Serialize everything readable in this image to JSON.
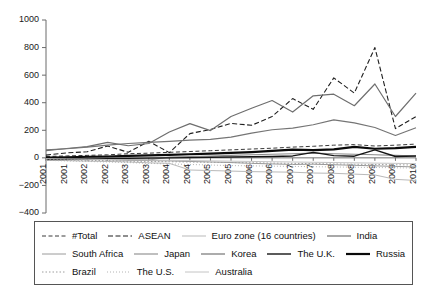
{
  "chart_data": {
    "type": "line",
    "title": "",
    "subtitle": "",
    "xlabel": "",
    "ylabel": "",
    "ylim": [
      -400,
      1000
    ],
    "yticks": [
      1000,
      800,
      600,
      400,
      200,
      0,
      -200,
      -400
    ],
    "grid": false,
    "legend_position": "bottom",
    "x": [
      "2001",
      "2001",
      "2002",
      "2002",
      "2003",
      "2003",
      "2004",
      "2004",
      "2005",
      "2005",
      "2006",
      "2006",
      "2007",
      "2007",
      "2008",
      "2008",
      "2009",
      "2009",
      "2010"
    ],
    "categories": [
      "2001",
      "2001",
      "2002",
      "2002",
      "2003",
      "2003",
      "2004",
      "2004",
      "2005",
      "2005",
      "2006",
      "2006",
      "2007",
      "2007",
      "2008",
      "2008",
      "2009",
      "2009",
      "2010"
    ],
    "series": [
      {
        "name": "#Total",
        "style": "dashed",
        "color": "#3a3a3a",
        "width": 1,
        "dash": "4,2.5",
        "values": [
          10,
          14,
          18,
          22,
          30,
          34,
          40,
          46,
          52,
          58,
          64,
          70,
          78,
          84,
          92,
          96,
          86,
          92,
          100
        ]
      },
      {
        "name": "ASEAN",
        "style": "dashed",
        "color": "#1f1f1f",
        "width": 1.1,
        "dash": "5,2.5",
        "values": [
          20,
          36,
          44,
          86,
          40,
          120,
          38,
          176,
          206,
          250,
          236,
          300,
          430,
          352,
          580,
          470,
          800,
          212,
          300
        ]
      },
      {
        "name": "Euro zone (16 countries)",
        "style": "solid",
        "color": "#b9b9b9",
        "width": 1,
        "dash": "none",
        "values": [
          -16,
          -20,
          -24,
          -26,
          -30,
          -36,
          -40,
          -88,
          -92,
          -96,
          -100,
          -102,
          -104,
          -110,
          -112,
          -118,
          -124,
          -156,
          -164
        ]
      },
      {
        "name": "India",
        "style": "solid",
        "color": "#6e6e6e",
        "width": 1.2,
        "dash": "none",
        "values": [
          52,
          68,
          82,
          112,
          88,
          104,
          188,
          248,
          198,
          300,
          360,
          416,
          332,
          450,
          462,
          378,
          536,
          300,
          470
        ]
      },
      {
        "name": "South Africa",
        "style": "solid",
        "color": "#9a9a9a",
        "width": 1,
        "dash": "none",
        "values": [
          -8,
          -10,
          -12,
          -14,
          -18,
          -20,
          -22,
          -26,
          -30,
          -34,
          -40,
          -44,
          -48,
          -46,
          -50,
          -54,
          -58,
          -62,
          -66
        ]
      },
      {
        "name": "Japan",
        "style": "solid",
        "color": "#8a8a8a",
        "width": 1.1,
        "dash": "none",
        "values": [
          -4,
          -6,
          -8,
          -10,
          -12,
          -16,
          6,
          10,
          14,
          18,
          22,
          26,
          30,
          34,
          30,
          26,
          22,
          18,
          14
        ]
      },
      {
        "name": "Korea",
        "style": "solid",
        "color": "#757575",
        "width": 1.2,
        "dash": "none",
        "values": [
          58,
          66,
          78,
          92,
          104,
          112,
          120,
          128,
          134,
          150,
          180,
          204,
          216,
          240,
          276,
          254,
          220,
          162,
          218
        ]
      },
      {
        "name": "The U.K.",
        "style": "solid",
        "color": "#151515",
        "width": 1.4,
        "dash": "none",
        "values": [
          -12,
          -10,
          -8,
          -6,
          -4,
          -2,
          0,
          2,
          4,
          6,
          8,
          10,
          14,
          40,
          16,
          12,
          58,
          10,
          14
        ]
      },
      {
        "name": "Russia",
        "style": "solid",
        "color": "#0a0a0a",
        "width": 2.2,
        "dash": "none",
        "values": [
          2,
          4,
          8,
          10,
          14,
          18,
          22,
          26,
          30,
          36,
          42,
          50,
          60,
          56,
          62,
          80,
          66,
          70,
          80
        ]
      },
      {
        "name": "Brazil",
        "style": "dotted",
        "color": "#9e9e9e",
        "width": 1,
        "dash": "1.5,2",
        "values": [
          -14,
          -16,
          -18,
          -20,
          -24,
          -26,
          -28,
          -30,
          -32,
          -34,
          -36,
          -38,
          -40,
          -42,
          -44,
          -46,
          -48,
          -50,
          -52
        ]
      },
      {
        "name": "The U.S.",
        "style": "dotted",
        "color": "#b4b4b4",
        "width": 1,
        "dash": "1,2",
        "values": [
          -18,
          -22,
          -26,
          -30,
          -34,
          -40,
          -44,
          -48,
          -52,
          -56,
          -58,
          -60,
          -62,
          -64,
          -66,
          -68,
          -70,
          -72,
          -74
        ]
      },
      {
        "name": "Australia",
        "style": "solid",
        "color": "#c4c4c4",
        "width": 1,
        "dash": "none",
        "values": [
          -6,
          -8,
          -10,
          -12,
          -14,
          -16,
          -18,
          -20,
          -22,
          -24,
          -26,
          -28,
          -30,
          -32,
          -34,
          -36,
          -38,
          -40,
          -42
        ]
      }
    ]
  },
  "legend": {
    "rows": [
      [
        {
          "label": "#Total",
          "series": 0
        },
        {
          "label": "ASEAN",
          "series": 1
        },
        {
          "label": "Euro zone (16 countries)",
          "series": 2
        },
        {
          "label": "India",
          "series": 3
        }
      ],
      [
        {
          "label": "South Africa",
          "series": 4
        },
        {
          "label": "Japan",
          "series": 5
        },
        {
          "label": "Korea",
          "series": 6
        },
        {
          "label": "The U.K.",
          "series": 7
        },
        {
          "label": "Russia",
          "series": 8
        }
      ],
      [
        {
          "label": "Brazil",
          "series": 9
        },
        {
          "label": "The U.S.",
          "series": 10
        },
        {
          "label": "Australia",
          "series": 11
        }
      ]
    ]
  },
  "plot": {
    "left": 46,
    "right": 416,
    "top": 20,
    "bottom": 213
  }
}
